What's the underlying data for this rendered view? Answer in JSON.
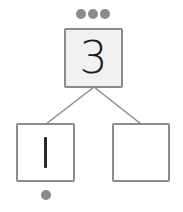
{
  "diagram": {
    "type": "number-bond",
    "whole": {
      "value": "3",
      "dots": 3
    },
    "parts": [
      {
        "value": "1",
        "dots": 1
      },
      {
        "value": "",
        "dots": 0
      }
    ]
  },
  "colors": {
    "border": "#8c8c8c",
    "dot": "#8a8a8a",
    "whole_fill": "#f1f1f1",
    "part_fill": "#ffffff",
    "text": "#1a1a1a"
  }
}
